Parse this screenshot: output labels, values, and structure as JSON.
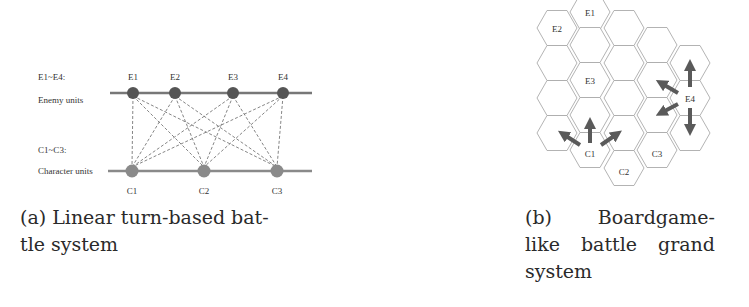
{
  "figure_a": {
    "enemy_legend": {
      "line1": "E1~E4:",
      "line2": "Enemy units"
    },
    "character_legend": {
      "line1": "C1~C3:",
      "line2": "Character units"
    },
    "enemies": [
      {
        "label": "E1",
        "x": 133
      },
      {
        "label": "E2",
        "x": 175
      },
      {
        "label": "E3",
        "x": 233
      },
      {
        "label": "E4",
        "x": 283
      }
    ],
    "characters": [
      {
        "label": "C1",
        "x": 132
      },
      {
        "label": "C2",
        "x": 204
      },
      {
        "label": "C3",
        "x": 277
      }
    ],
    "colors": {
      "enemy_node": "#555555",
      "character_node": "#8a8a8a",
      "line": "#777777",
      "dashed": "#666666"
    },
    "caption": {
      "line1": "(a) Linear turn-based bat-",
      "line2": "tle system"
    }
  },
  "figure_b": {
    "hex_labels": {
      "E1": "E1",
      "E2": "E2",
      "E3": "E3",
      "E4": "E4",
      "C1": "C1",
      "C2": "C2",
      "C3": "C3"
    },
    "colors": {
      "hex_stroke": "#aaaaaa",
      "arrow": "#5a5a5a"
    },
    "caption": {
      "line1_words": [
        "(b)",
        "Boardgame-"
      ],
      "line2_words": [
        "like",
        "battle",
        "grand"
      ],
      "line3": "system"
    }
  }
}
